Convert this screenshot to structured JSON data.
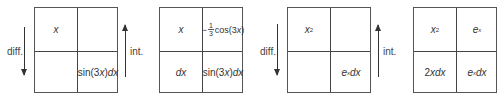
{
  "colors": {
    "line": "#444444",
    "text": "#333333",
    "background": "#ffffff"
  },
  "labels": {
    "differentiate": "diff.",
    "integrate": "int."
  },
  "example1": {
    "step1": {
      "top_left": "x",
      "top_right": "",
      "bottom_left": "",
      "bottom_right": {
        "func": "sin(3",
        "var": "x",
        "close": ")",
        "d": "dx"
      }
    },
    "step2": {
      "top_left": "x",
      "top_right": {
        "sign": "−",
        "num": "1",
        "den": "3",
        "func": "cos(3",
        "var": "x",
        "close": ")"
      },
      "bottom_left": "dx",
      "bottom_right": {
        "func": "sin(3",
        "var": "x",
        "close": ")",
        "d": "dx"
      }
    }
  },
  "example2": {
    "step1": {
      "top_left": {
        "base": "x",
        "exp": "2"
      },
      "top_right": "",
      "bottom_left": "",
      "bottom_right": {
        "base": "e",
        "exp": "x",
        "d": "dx"
      }
    },
    "step2": {
      "top_left": {
        "base": "x",
        "exp": "2"
      },
      "top_right": {
        "base": "e",
        "exp": "x"
      },
      "bottom_left": {
        "coef": "2",
        "var": "xdx"
      },
      "bottom_right": {
        "base": "e",
        "exp": "x",
        "d": "dx"
      }
    }
  }
}
